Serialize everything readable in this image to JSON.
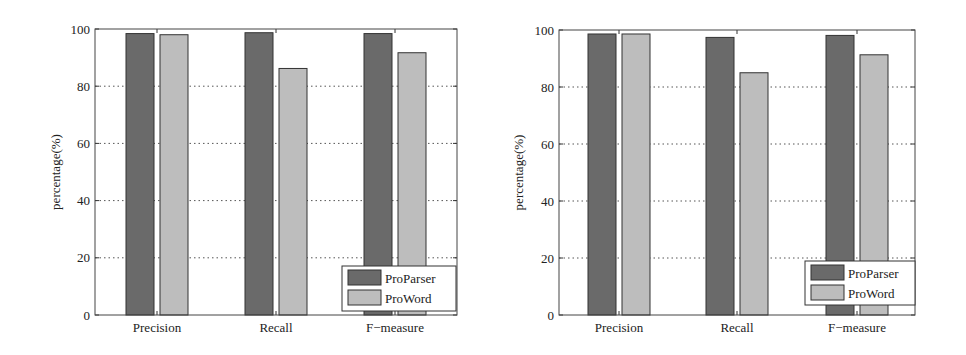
{
  "chart_data": [
    {
      "type": "bar",
      "title": "",
      "xlabel": "",
      "ylabel": "percentage(%)",
      "categories": [
        "Precision",
        "Recall",
        "F−measure"
      ],
      "series": [
        {
          "name": "ProParser",
          "color": "#6a6a6a",
          "values": [
            98.4,
            98.7,
            98.4
          ]
        },
        {
          "name": "ProWord",
          "color": "#bdbdbd",
          "values": [
            98.0,
            86.2,
            91.7
          ]
        }
      ],
      "ylim": [
        0,
        100
      ],
      "yticks": [
        0,
        20,
        40,
        60,
        80,
        100
      ],
      "grid": "dotted horizontal",
      "legend_position": "lower right"
    },
    {
      "type": "bar",
      "title": "",
      "xlabel": "",
      "ylabel": "percentage(%)",
      "categories": [
        "Precision",
        "Recall",
        "F−measure"
      ],
      "series": [
        {
          "name": "ProParser",
          "color": "#6a6a6a",
          "values": [
            98.6,
            97.4,
            98.1
          ]
        },
        {
          "name": "ProWord",
          "color": "#bdbdbd",
          "values": [
            98.6,
            85.0,
            91.3
          ]
        }
      ],
      "ylim": [
        0,
        100
      ],
      "yticks": [
        0,
        20,
        40,
        60,
        80,
        100
      ],
      "grid": "dotted horizontal",
      "legend_position": "lower right"
    }
  ]
}
